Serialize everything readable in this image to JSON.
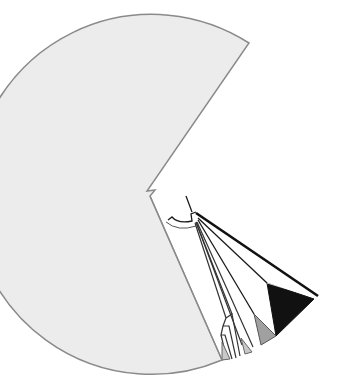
{
  "diagram": {
    "type": "radial-phylogenetic-tree",
    "labels_visible": false,
    "colors": {
      "background": "#ffffff",
      "large_clade_fill": "#ececec",
      "large_clade_stroke": "#8a8a8a",
      "branch_stroke": "#1a1a1a",
      "small_clade_fill_light": "#c8c8c8",
      "small_clade_fill_mid": "#a0a0a0",
      "small_clade_fill_dark": "#111111"
    },
    "clades": [
      {
        "id": "large-gray-clade",
        "fill": "light-gray",
        "description": "large collapsed clade wedge"
      },
      {
        "id": "black-clade",
        "fill": "black",
        "description": "collapsed clade triangle"
      },
      {
        "id": "mid-gray-clade",
        "fill": "mid-gray",
        "description": "collapsed clade triangle"
      },
      {
        "id": "small-gray-clade-1",
        "fill": "light-gray",
        "description": "collapsed clade triangle"
      },
      {
        "id": "small-gray-clade-2",
        "fill": "light-gray",
        "description": "collapsed clade triangle"
      }
    ]
  }
}
